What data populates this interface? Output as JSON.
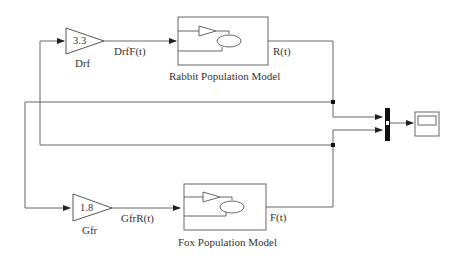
{
  "diagram": {
    "gains": [
      {
        "name": "Drf",
        "value": "3.3",
        "output_signal": "DrfF(t)"
      },
      {
        "name": "Gfr",
        "value": "1.8",
        "output_signal": "GfrR(t)"
      }
    ],
    "subsystems": [
      {
        "name": "Rabbit Population Model",
        "output_signal": "R(t)"
      },
      {
        "name": "Fox Population Model",
        "output_signal": "F(t)"
      }
    ],
    "mux": {
      "inputs": 2
    },
    "scope": {
      "name": "Scope"
    },
    "colors": {
      "line": "#555555",
      "block": "#444444",
      "mux": "#111111"
    }
  }
}
